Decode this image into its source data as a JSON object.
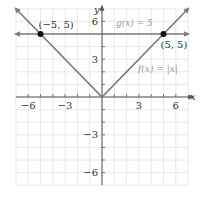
{
  "chart_data": {
    "type": "line",
    "title": "",
    "xlabel": "x",
    "ylabel": "y",
    "xlim": [
      -7,
      7
    ],
    "ylim": [
      -7,
      7
    ],
    "grid": true,
    "x_ticks": [
      -6,
      -3,
      3,
      6
    ],
    "y_ticks": [
      6,
      3,
      -3,
      -6
    ],
    "x_tick_labels": [
      "−6",
      "−3",
      "3",
      "6"
    ],
    "y_tick_labels": [
      "6",
      "3",
      "−3",
      "−6"
    ],
    "series": [
      {
        "name": "f(x) = |x|",
        "label": "f(x) = |x|",
        "x": [
          -7,
          0,
          7
        ],
        "y": [
          7,
          0,
          7
        ]
      },
      {
        "name": "g(x) = 5",
        "label": "g(x) = 5",
        "x": [
          -7,
          7
        ],
        "y": [
          5,
          5
        ]
      }
    ],
    "points": [
      {
        "label": "(−5, 5)",
        "x": -5,
        "y": 5
      },
      {
        "label": "(5, 5)",
        "x": 5,
        "y": 5
      }
    ],
    "colors": {
      "line": "#7a7a7a",
      "grid": "#e2e2e2",
      "axis": "#555555",
      "point": "#111111",
      "function_label": "#9a9a9a"
    }
  }
}
